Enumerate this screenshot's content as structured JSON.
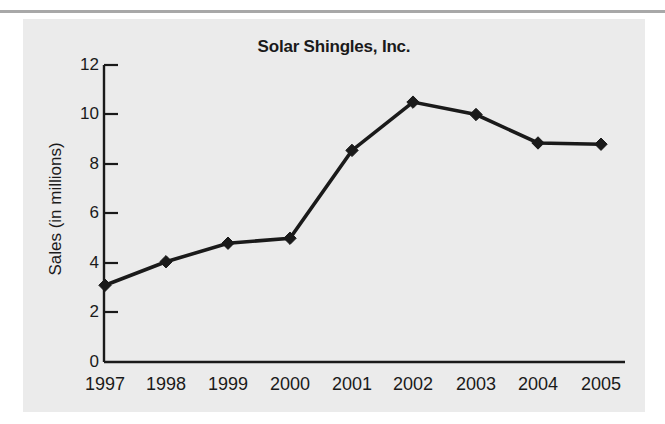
{
  "page": {
    "background_color": "#ffffff",
    "panel_background_color": "#ebebeb",
    "top_rule_color": "#a8a8a8"
  },
  "chart_data": {
    "type": "line",
    "title": "Solar Shingles, Inc.",
    "xlabel": "",
    "ylabel": "Sales (in millions)",
    "categories": [
      "1997",
      "1998",
      "1999",
      "2000",
      "2001",
      "2002",
      "2003",
      "2004",
      "2005"
    ],
    "values": [
      3.1,
      4.05,
      4.8,
      5.0,
      8.55,
      10.5,
      10.0,
      8.85,
      8.8
    ],
    "series": [
      {
        "name": "Sales (in millions)",
        "values": [
          3.1,
          4.05,
          4.8,
          5.0,
          8.55,
          10.5,
          10.0,
          8.85,
          8.8
        ]
      }
    ],
    "ylim": [
      0,
      12
    ],
    "ytick_labels": [
      "0",
      "2",
      "4",
      "6",
      "8",
      "10",
      "12"
    ],
    "ytick_values": [
      0,
      2,
      4,
      6,
      8,
      10,
      12
    ],
    "xtick_labels": [
      "1997",
      "1998",
      "1999",
      "2000",
      "2001",
      "2002",
      "2003",
      "2004",
      "2005"
    ],
    "grid": false,
    "legend": "none",
    "marker": "diamond",
    "line_color": "#1a1a1a",
    "marker_color": "#1a1a1a",
    "axis_color": "#1a1a1a",
    "annotations": []
  }
}
